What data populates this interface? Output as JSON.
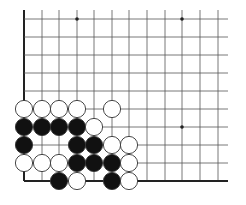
{
  "board": {
    "description": "Go board fragment (lower-left corner)",
    "columns_x": [
      24,
      42,
      59,
      77,
      94,
      112,
      129,
      147,
      165,
      182,
      200,
      218
    ],
    "rows_y": [
      19,
      37,
      55,
      73,
      91,
      109,
      127,
      145,
      163,
      181
    ],
    "right_extent": 228,
    "top_extent": 10,
    "left_edge_is_border": true,
    "bottom_edge_is_border": true,
    "star_points": [
      [
        3,
        0
      ],
      [
        9,
        0
      ],
      [
        9,
        6
      ]
    ],
    "stone_radius": 8.6,
    "colors": {
      "line": "#555555",
      "border": "#222222",
      "black": "#111111",
      "white": "#ffffff",
      "stone_outline": "#333333"
    },
    "stones": [
      {
        "c": 0,
        "r": 5,
        "color": "white"
      },
      {
        "c": 1,
        "r": 5,
        "color": "white"
      },
      {
        "c": 2,
        "r": 5,
        "color": "white"
      },
      {
        "c": 3,
        "r": 5,
        "color": "white"
      },
      {
        "c": 5,
        "r": 5,
        "color": "white"
      },
      {
        "c": 0,
        "r": 6,
        "color": "black"
      },
      {
        "c": 1,
        "r": 6,
        "color": "black"
      },
      {
        "c": 2,
        "r": 6,
        "color": "black"
      },
      {
        "c": 3,
        "r": 6,
        "color": "black"
      },
      {
        "c": 4,
        "r": 6,
        "color": "white"
      },
      {
        "c": 0,
        "r": 7,
        "color": "black"
      },
      {
        "c": 3,
        "r": 7,
        "color": "black"
      },
      {
        "c": 4,
        "r": 7,
        "color": "black"
      },
      {
        "c": 5,
        "r": 7,
        "color": "white"
      },
      {
        "c": 6,
        "r": 7,
        "color": "white"
      },
      {
        "c": 0,
        "r": 8,
        "color": "white"
      },
      {
        "c": 1,
        "r": 8,
        "color": "white"
      },
      {
        "c": 2,
        "r": 8,
        "color": "white"
      },
      {
        "c": 3,
        "r": 8,
        "color": "black"
      },
      {
        "c": 4,
        "r": 8,
        "color": "black"
      },
      {
        "c": 5,
        "r": 8,
        "color": "black"
      },
      {
        "c": 6,
        "r": 8,
        "color": "white"
      },
      {
        "c": 2,
        "r": 9,
        "color": "black"
      },
      {
        "c": 3,
        "r": 9,
        "color": "white"
      },
      {
        "c": 5,
        "r": 9,
        "color": "black"
      },
      {
        "c": 6,
        "r": 9,
        "color": "white"
      }
    ]
  }
}
